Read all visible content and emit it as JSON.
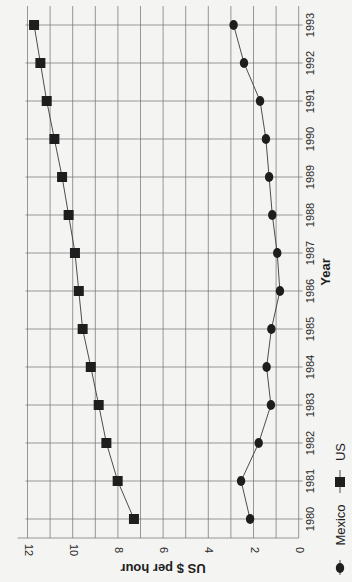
{
  "chart_data": {
    "type": "line",
    "orientation": "rotated-90-clockwise",
    "title": "",
    "xlabel": "Year",
    "ylabel": "US $ per hour",
    "x": [
      "1980",
      "1981",
      "1982",
      "1983",
      "1984",
      "1985",
      "1986",
      "1987",
      "1988",
      "1989",
      "1990",
      "1991",
      "1992",
      "1993"
    ],
    "ylim": [
      0,
      12
    ],
    "yticks": [
      "0",
      "2",
      "4",
      "6",
      "8",
      "10",
      "12"
    ],
    "grid": true,
    "legend_position": "bottom",
    "series": [
      {
        "name": "Mexico",
        "marker": "circle",
        "color": "#1e1e1e",
        "values": [
          2.15,
          2.55,
          1.77,
          1.23,
          1.42,
          1.21,
          0.83,
          0.95,
          1.17,
          1.31,
          1.45,
          1.71,
          2.42,
          2.88
        ]
      },
      {
        "name": "US",
        "marker": "square",
        "color": "#1e1e1e",
        "values": [
          7.29,
          8.01,
          8.51,
          8.85,
          9.2,
          9.56,
          9.73,
          9.9,
          10.18,
          10.47,
          10.81,
          11.15,
          11.43,
          11.71
        ]
      }
    ]
  }
}
